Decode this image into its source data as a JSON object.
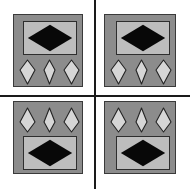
{
  "figure": {
    "canvas": {
      "width": 190,
      "height": 189,
      "background": "#ffffff"
    },
    "colors": {
      "background": "#ffffff",
      "divider": "#1a1a1a",
      "panel_fill": "#8c8c8c",
      "panel_border": "#3a3a3a",
      "frame_fill": "#bdbdbd",
      "frame_border": "#2e2e2e",
      "diamond_fill": "#080808",
      "kite_fill": "#d6d6d6",
      "kite_stroke": "#242424"
    },
    "dividers": [
      {
        "name": "vertical-divider",
        "orientation": "vertical",
        "position": 94,
        "thickness": 2
      },
      {
        "name": "horizontal-divider",
        "orientation": "horizontal",
        "position": 95,
        "thickness": 2
      }
    ],
    "panels": [
      {
        "id": "top-left",
        "label": "Top left panel",
        "x": 13,
        "y": 14,
        "width": 70,
        "height": 73,
        "layout": "diamond-above-kites",
        "frame": {
          "x": 9,
          "y": 6,
          "width": 54,
          "height": 34
        },
        "kites": {
          "x": 5,
          "y": 44,
          "width": 61,
          "height": 26,
          "count": 3
        }
      },
      {
        "id": "top-right",
        "label": "Top right panel",
        "x": 104,
        "y": 14,
        "width": 72,
        "height": 73,
        "layout": "diamond-above-kites",
        "frame": {
          "x": 11,
          "y": 6,
          "width": 54,
          "height": 34
        },
        "kites": {
          "x": 5,
          "y": 44,
          "width": 62,
          "height": 26,
          "count": 3
        }
      },
      {
        "id": "bottom-left",
        "label": "Bottom left panel",
        "x": 13,
        "y": 101,
        "width": 70,
        "height": 73,
        "layout": "kites-above-diamond",
        "frame": {
          "x": 9,
          "y": 34,
          "width": 54,
          "height": 34
        },
        "kites": {
          "x": 5,
          "y": 5,
          "width": 61,
          "height": 26,
          "count": 3
        }
      },
      {
        "id": "bottom-right",
        "label": "Bottom right panel",
        "x": 104,
        "y": 101,
        "width": 72,
        "height": 73,
        "layout": "kites-above-diamond",
        "frame": {
          "x": 11,
          "y": 34,
          "width": 54,
          "height": 34
        },
        "kites": {
          "x": 5,
          "y": 5,
          "width": 62,
          "height": 26,
          "count": 3
        }
      }
    ],
    "kite_variants": [
      {
        "name": "wide",
        "width": 17,
        "height": 26
      },
      {
        "name": "narrow",
        "width": 13,
        "height": 26
      },
      {
        "name": "wide",
        "width": 17,
        "height": 26
      }
    ]
  }
}
